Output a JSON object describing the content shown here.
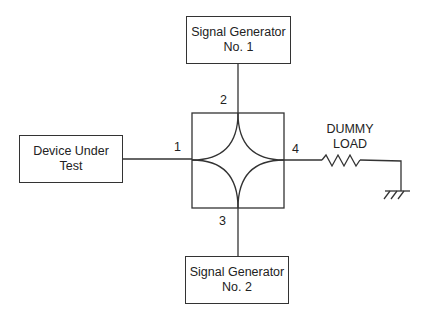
{
  "diagram": {
    "type": "hybrid-coupler-test-setup",
    "blocks": {
      "sig_gen_1": {
        "line1": "Signal Generator",
        "line2": "No. 1"
      },
      "sig_gen_2": {
        "line1": "Signal Generator",
        "line2": "No. 2"
      },
      "dut": {
        "line1": "Device Under",
        "line2": "Test"
      },
      "load": {
        "line1": "DUMMY",
        "line2": "LOAD"
      }
    },
    "ports": {
      "p1": "1",
      "p2": "2",
      "p3": "3",
      "p4": "4"
    },
    "connections": [
      {
        "from": "dut",
        "to": "port 1"
      },
      {
        "from": "sig_gen_1",
        "to": "port 2"
      },
      {
        "from": "sig_gen_2",
        "to": "port 3"
      },
      {
        "from": "port 4",
        "to": "dummy load resistor",
        "then": "ground"
      }
    ],
    "line_color": "#333333"
  }
}
